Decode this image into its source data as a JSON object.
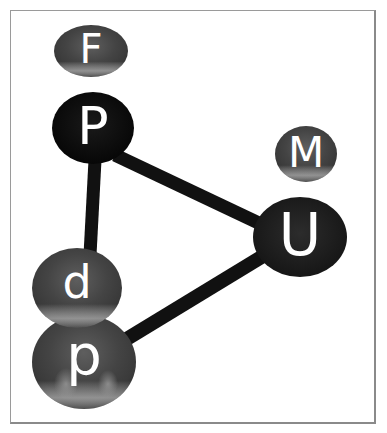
{
  "diagram": {
    "type": "3d-graph",
    "frame": {
      "x": 10,
      "y": 10,
      "width": 366,
      "height": 414
    },
    "nodes": [
      {
        "id": "F",
        "label": "F",
        "cx": 91,
        "cy": 51,
        "rx": 37,
        "ry": 26,
        "shade": "grey",
        "font_size": 40
      },
      {
        "id": "P",
        "label": "P",
        "cx": 93,
        "cy": 128,
        "rx": 41,
        "ry": 36,
        "shade": "black",
        "font_size": 52
      },
      {
        "id": "M",
        "label": "M",
        "cx": 306,
        "cy": 154,
        "rx": 31,
        "ry": 28,
        "shade": "grey",
        "font_size": 42
      },
      {
        "id": "U",
        "label": "U",
        "cx": 300,
        "cy": 237,
        "rx": 47,
        "ry": 40,
        "shade": "dark",
        "font_size": 58
      },
      {
        "id": "d",
        "label": "d",
        "cx": 77,
        "cy": 288,
        "rx": 45,
        "ry": 40,
        "shade": "grey",
        "font_size": 46
      },
      {
        "id": "p",
        "label": "p",
        "cx": 84,
        "cy": 362,
        "rx": 52,
        "ry": 47,
        "shade": "grey-mid",
        "font_size": 56
      }
    ],
    "edges": [
      {
        "from": "P",
        "to": "U",
        "x1": 115,
        "y1": 155,
        "x2": 265,
        "y2": 226,
        "width": 13
      },
      {
        "from": "P",
        "to": "d",
        "x1": 95,
        "y1": 160,
        "x2": 90,
        "y2": 255,
        "width": 13
      },
      {
        "from": "U",
        "to": "p",
        "x1": 268,
        "y1": 253,
        "x2": 125,
        "y2": 340,
        "width": 14
      }
    ],
    "colors": {
      "background": "#ffffff",
      "frame_border": "#8a8a8a",
      "edge": "#111111",
      "node_black": "#0b0b0b",
      "node_dark": "#1e1e1e",
      "node_grey": "#4a4a4a",
      "label": "#ffffff"
    }
  }
}
